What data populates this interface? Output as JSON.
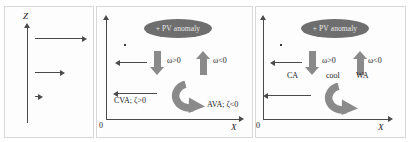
{
  "figure": {
    "title": "",
    "panels": [
      {
        "id": "left",
        "name": "vertical-shear-profile",
        "axis_vertical_label": "Z",
        "arrows": [
          {
            "name": "wind-arrow-upper",
            "length": "long",
            "direction": "right"
          },
          {
            "name": "wind-arrow-middle",
            "length": "medium",
            "direction": "right"
          },
          {
            "name": "wind-arrow-lower",
            "length": "short",
            "direction": "right"
          }
        ]
      },
      {
        "id": "middle",
        "name": "vorticity-advection-panel",
        "axis_vertical_label": "",
        "axis_horizontal_label": "X",
        "origin_label": "0",
        "pv_label": "+ PV anomaly",
        "omega_left": "ω>0",
        "omega_right": "ω<0",
        "advection_left": "CVA; ζ>0",
        "advection_right": "AVA; ζ<0"
      },
      {
        "id": "right",
        "name": "thermal-advection-panel",
        "axis_horizontal_label": "X",
        "origin_label": "0",
        "pv_label": "+ PV anomaly",
        "omega_left": "ω>0",
        "omega_right": "ω<0",
        "cold_advection": "CA",
        "center_label": "cool",
        "warm_advection": "WA"
      }
    ]
  },
  "colors": {
    "ellipse_fill": "#6e6e6e",
    "block_arrow": "#8a8a8a",
    "axis": "#4a4a4a",
    "text": "#1a1a1a",
    "panel_border": "#d8d8d8"
  }
}
